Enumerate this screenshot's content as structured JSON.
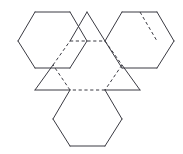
{
  "figure": {
    "kind": "geometric-net-diagram",
    "title": "",
    "caption": "",
    "background_color": "#ffffff",
    "stroke_color": "#3a3a42",
    "fold_line_style": "dashed",
    "solid_line_style": "solid",
    "stroke_width_px": 1,
    "canvas": {
      "width": 183,
      "height": 154
    },
    "faces": [
      {
        "id": "center-hexagon",
        "name": "central-dashed-hexagon",
        "shape": "hexagon",
        "edge_style": "dashed",
        "label": "",
        "points": "70,41 105,41 122,65 105,90 70,90 53,65"
      },
      {
        "id": "hexagon-top-left",
        "name": "upper-left-hexagon",
        "shape": "hexagon",
        "edge_style": "solid",
        "label": "",
        "points": "35,12 70,12 87,41 70,68 35,68 18,41"
      },
      {
        "id": "hexagon-top-right",
        "name": "upper-right-hexagon",
        "shape": "hexagon",
        "edge_style": "solid",
        "label": "",
        "points": "122,12 157,12 174,41 157,68 122,68 105,41"
      },
      {
        "id": "hexagon-bottom",
        "name": "lower-hexagon",
        "shape": "hexagon",
        "edge_style": "solid",
        "label": "",
        "points": "70,90 105,90 122,119 105,146 70,146 53,119"
      },
      {
        "id": "triangle-top",
        "name": "upper-triangle",
        "shape": "triangle",
        "edge_style": "solid",
        "label": "",
        "points": "70,41 105,41 87,12"
      },
      {
        "id": "triangle-left",
        "name": "left-triangle",
        "shape": "triangle",
        "edge_style": "solid",
        "label": "",
        "points": "70,90 53,65 35,90"
      },
      {
        "id": "triangle-right",
        "name": "right-triangle",
        "shape": "triangle",
        "edge_style": "solid",
        "label": "",
        "points": "105,90 122,65 140,90"
      }
    ],
    "solid_edges": [
      {
        "name": "hexagon-top-left-edge-top",
        "d": "M 35,12 L 70,12"
      },
      {
        "name": "hexagon-top-left-edge-upper-right",
        "d": "M 70,12 L 87,41"
      },
      {
        "name": "hexagon-top-left-edge-lower-right",
        "d": "M 87,41 L 70,68"
      },
      {
        "name": "hexagon-top-left-edge-bottom",
        "d": "M 70,68 L 35,68"
      },
      {
        "name": "hexagon-top-left-edge-lower-left",
        "d": "M 35,68 L 18,41"
      },
      {
        "name": "hexagon-top-left-edge-upper-left",
        "d": "M 18,41 L 35,12"
      },
      {
        "name": "triangle-top-edge-left",
        "d": "M 70,41 L 87,12"
      },
      {
        "name": "triangle-top-edge-right",
        "d": "M 87,12 L 105,41"
      },
      {
        "name": "hexagon-top-right-edge-top",
        "d": "M 122,12 L 157,12"
      },
      {
        "name": "hexagon-top-right-edge-top-extra",
        "d": "M 157,12 L 174,41"
      },
      {
        "name": "hexagon-top-right-edge-right",
        "d": "M 174,41 L 157,68"
      },
      {
        "name": "hexagon-top-right-edge-bottom",
        "d": "M 157,68 L 122,68"
      },
      {
        "name": "hexagon-top-right-edge-lower-left",
        "d": "M 122,68 L 105,41"
      },
      {
        "name": "hexagon-top-right-edge-upper-left",
        "d": "M 105,41 L 122,12"
      },
      {
        "name": "triangle-left-edge-upper",
        "d": "M 53,65 L 35,90"
      },
      {
        "name": "triangle-left-edge-lower",
        "d": "M 35,90 L 70,90"
      },
      {
        "name": "triangle-right-edge-upper",
        "d": "M 122,65 L 140,90"
      },
      {
        "name": "triangle-right-edge-lower",
        "d": "M 140,90 L 105,90"
      },
      {
        "name": "hexagon-bottom-edge-lower-left",
        "d": "M 70,90 L 53,119"
      },
      {
        "name": "hexagon-bottom-edge-left",
        "d": "M 53,119 L 70,146"
      },
      {
        "name": "hexagon-bottom-edge-bottom",
        "d": "M 70,146 L 105,146"
      },
      {
        "name": "hexagon-bottom-edge-right",
        "d": "M 105,146 L 122,119"
      },
      {
        "name": "hexagon-bottom-edge-lower-right",
        "d": "M 122,119 L 105,90"
      }
    ],
    "fold_edges": [
      {
        "name": "fold-center-hexagon-top",
        "d": "M 70,41 L 105,41"
      },
      {
        "name": "fold-center-hexagon-upper-right",
        "d": "M 105,41 L 122,65"
      },
      {
        "name": "fold-center-hexagon-lower-right",
        "d": "M 122,65 L 105,90"
      },
      {
        "name": "fold-center-hexagon-bottom",
        "d": "M 105,90 L 70,90"
      },
      {
        "name": "fold-center-hexagon-lower-left",
        "d": "M 70,90 L 53,65"
      },
      {
        "name": "fold-center-hexagon-upper-left",
        "d": "M 53,65 L 70,41"
      },
      {
        "name": "fold-upper-right-hexagon-inner",
        "d": "M 140,12 L 157,41"
      }
    ]
  }
}
